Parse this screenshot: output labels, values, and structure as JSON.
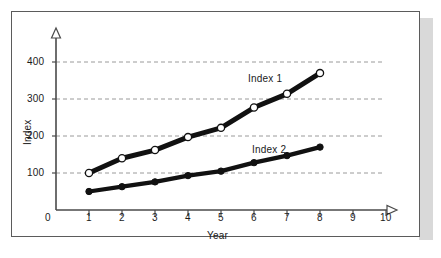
{
  "chart_data": {
    "type": "line",
    "title": "",
    "xlabel": "Year",
    "ylabel": "Index",
    "xlim": [
      0,
      10
    ],
    "ylim": [
      0,
      440
    ],
    "grid": true,
    "grid_style": "dashed-horizontal",
    "legend": "inline-annotations",
    "x": [
      1,
      2,
      3,
      4,
      5,
      6,
      7,
      8
    ],
    "xtick_labels": [
      "0",
      "1",
      "2",
      "3",
      "4",
      "5",
      "6",
      "7",
      "8",
      "9",
      "10"
    ],
    "ytick_labels": [
      "0",
      "100",
      "200",
      "300",
      "400"
    ],
    "ytick_values": [
      0,
      100,
      200,
      300,
      400
    ],
    "series": [
      {
        "name": "Index 1",
        "marker": "open-circle",
        "line_color": "#111111",
        "marker_fill": "#ffffff",
        "values": [
          100,
          140,
          162,
          197,
          222,
          277,
          314,
          370
        ]
      },
      {
        "name": "Index 2",
        "marker": "filled-circle",
        "line_color": "#111111",
        "marker_fill": "#111111",
        "values": [
          50,
          63,
          76,
          93,
          105,
          128,
          147,
          170
        ]
      }
    ],
    "annotations": [
      {
        "text": "Index 1",
        "x": 6.05,
        "y": 330
      },
      {
        "text": "Index 2",
        "x": 6.15,
        "y": 185
      }
    ]
  },
  "axes": {
    "x_arrow": "open-triangle-right",
    "y_arrow": "open-triangle-up"
  },
  "colors": {
    "axis": "#4a4a4a",
    "grid": "#8f8f8f",
    "series": "#111111",
    "frame_border": "#5b5b5b",
    "shadow": "#d9d9d9",
    "background": "#ffffff",
    "text": "#1a1a1a"
  }
}
